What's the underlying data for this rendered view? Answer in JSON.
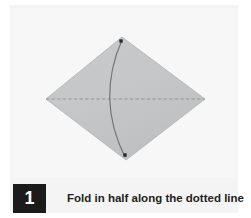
{
  "figure": {
    "kind": "origami-instruction-step",
    "background_color": "#ffffff",
    "panel_color": "#f4f4f4"
  },
  "caption": {
    "step_number": "1",
    "text": "Fold in half along the dotted line",
    "badge_background": "#1b1b1b",
    "badge_text_color": "#ffffff",
    "text_color": "#231f20"
  },
  "diagram": {
    "shape_name": "square-sheet-rotated-diamond",
    "fill_color": "#c4c6c7",
    "edge_color": "#b0b2b3",
    "vertices": {
      "top": {
        "x": 122,
        "y": 37
      },
      "right": {
        "x": 205,
        "y": 99
      },
      "bottom": {
        "x": 126,
        "y": 160
      },
      "left": {
        "x": 46,
        "y": 99
      }
    },
    "fold_line": {
      "name": "dotted-fold-line",
      "style": "dashed",
      "color": "#8b8d8f",
      "from": {
        "x": 46,
        "y": 99
      },
      "to": {
        "x": 205,
        "y": 99
      }
    },
    "fold_arc": {
      "name": "fold-motion-arc",
      "color": "#6e7072",
      "from": {
        "x": 122,
        "y": 40
      },
      "to": {
        "x": 125,
        "y": 157
      },
      "control": {
        "x": 96,
        "y": 99
      }
    },
    "markers": [
      {
        "name": "corner-dot-top",
        "x": 121,
        "y": 41,
        "color": "#2a2a2a"
      },
      {
        "name": "corner-dot-bottom",
        "x": 125,
        "y": 155,
        "color": "#2a2a2a"
      }
    ]
  }
}
